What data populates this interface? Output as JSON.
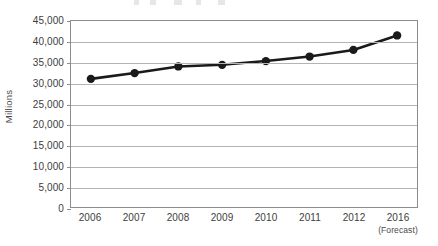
{
  "chart_data": {
    "type": "line",
    "title": "",
    "xlabel": "",
    "ylabel": "Millions",
    "categories": [
      "2006",
      "2007",
      "2008",
      "2009",
      "2010",
      "2011",
      "2012",
      "2016"
    ],
    "category_sublabels": [
      "",
      "",
      "",
      "",
      "",
      "",
      "",
      "(Forecast)"
    ],
    "values": [
      31000,
      32400,
      34000,
      34400,
      35300,
      36400,
      38000,
      41500
    ],
    "ylim": [
      0,
      45000
    ],
    "yticks": [
      0,
      5000,
      10000,
      15000,
      20000,
      25000,
      30000,
      35000,
      40000,
      45000
    ],
    "ytick_labels": [
      "0",
      "5,000",
      "10,000",
      "15,000",
      "20,000",
      "25,000",
      "30,000",
      "35,000",
      "40,000",
      "45,000"
    ],
    "grid": "horizontal",
    "legend": "none",
    "series_color": "#1a1a1a",
    "marker": "circle",
    "grid_color": "#b4b4b4",
    "axis_color": "#8d8d8d",
    "text_color": "#3d3d3d"
  }
}
